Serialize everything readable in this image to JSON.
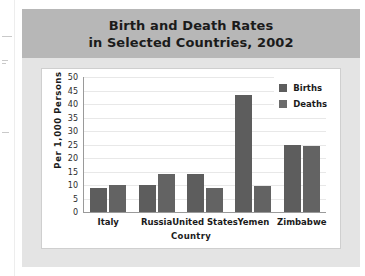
{
  "chart_data": {
    "type": "bar",
    "title": "Birth and Death Rates in Selected Countries, 2002",
    "title_lines": [
      "Birth and Death Rates",
      "in Selected Countries, 2002"
    ],
    "categories": [
      "Italy",
      "Russia",
      "United States",
      "Yemen",
      "Zimbabwe"
    ],
    "series": [
      {
        "name": "Births",
        "values": [
          9,
          10,
          14,
          43.5,
          25
        ],
        "color": "#5d5d5d"
      },
      {
        "name": "Deaths",
        "values": [
          10,
          14,
          9,
          9.5,
          24.5
        ],
        "color": "#636363"
      }
    ],
    "xlabel": "Country",
    "ylabel": "Per 1,000  Persons",
    "ylim": [
      0,
      50
    ],
    "yticks": [
      50,
      45,
      40,
      35,
      30,
      25,
      20,
      15,
      10,
      5,
      0
    ],
    "grid": true,
    "legend_position": "top-right"
  },
  "legend": {
    "items": [
      {
        "label": "Births"
      },
      {
        "label": "Deaths"
      }
    ]
  }
}
